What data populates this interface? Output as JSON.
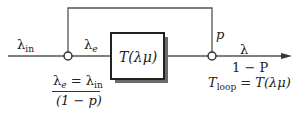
{
  "diagram": {
    "input": {
      "symbol": "λ",
      "subscript": "in"
    },
    "effective": {
      "symbol": "λ",
      "subscript": "e"
    },
    "block": {
      "label": "T(λμ)"
    },
    "feedback": {
      "label": "p"
    },
    "output": {
      "label": "λ",
      "fraction_denominator": "1 − P"
    },
    "effective_equation": {
      "lhs_symbol": "λ",
      "lhs_subscript": "e",
      "equals": " = ",
      "rhs_symbol": "λ",
      "rhs_subscript": "in",
      "denominator": "(1 − p)"
    },
    "loop_equation": {
      "symbol": "T",
      "subscript": "loop",
      "rhs": " = T(λμ)"
    },
    "colors": {
      "line": "#555555",
      "box_border": "#222222",
      "shadow": "#666666"
    }
  }
}
